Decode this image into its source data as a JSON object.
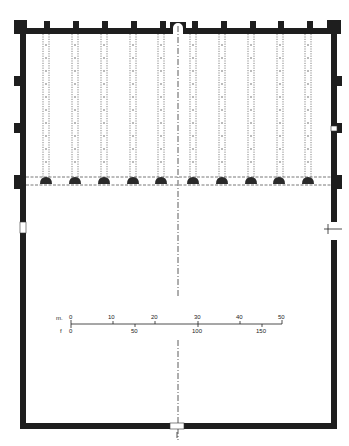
{
  "diagram": {
    "type": "architectural-floor-plan",
    "colors": {
      "wall": "#1e1e1e",
      "column": "#2a2a2a",
      "dotted": "#555555",
      "background": "#ffffff"
    },
    "top_buttress_x": [
      44,
      73,
      102,
      131,
      160,
      192,
      221,
      250,
      278,
      307
    ],
    "column_rows_x": [
      45,
      74,
      103,
      132,
      160,
      192,
      221,
      250,
      279,
      308
    ],
    "left_buttress_y": [
      76,
      125
    ],
    "right_buttress_y": [
      76,
      125
    ],
    "scale_bar": {
      "meters_label": "m.",
      "feet_label": "f",
      "meters_ticks": [
        "0",
        "10",
        "20",
        "30",
        "40",
        "50"
      ],
      "feet_ticks": [
        "0",
        "50",
        "100",
        "150"
      ]
    }
  }
}
